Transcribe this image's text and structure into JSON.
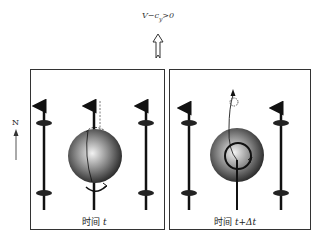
{
  "condition_label": "V−c",
  "condition_sub": "y",
  "condition_tail": ">0",
  "north_label": "N",
  "panels": [
    {
      "caption_cn": "时间",
      "caption_var": "t"
    },
    {
      "caption_cn": "时间",
      "caption_var": "t+Δt"
    }
  ],
  "colors": {
    "border": "#333333",
    "line": "#111111",
    "sphere_light": "#eeeeee",
    "sphere_dark": "#222222"
  }
}
